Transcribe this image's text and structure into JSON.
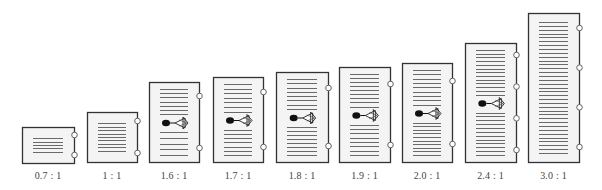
{
  "figure": {
    "page_fill": "#f4f4f4",
    "border_color": "#333333",
    "line_color": "#6a6a6a",
    "hole_color": "#ffffff"
  },
  "pages": [
    {
      "ratio": "0.7 : 1",
      "x": 22,
      "y": 127,
      "w": 52,
      "h": 36,
      "lines": [
        5
      ],
      "holes": 2,
      "figure": false
    },
    {
      "ratio": "1 : 1",
      "x": 87,
      "y": 112,
      "w": 50,
      "h": 50,
      "lines": [
        9
      ],
      "holes": 2,
      "figure": false
    },
    {
      "ratio": "1.6 : 1",
      "x": 149,
      "y": 82,
      "w": 50,
      "h": 80,
      "lines": [
        7,
        5
      ],
      "holes": 2,
      "figure": true
    },
    {
      "ratio": "1.7 : 1",
      "x": 213,
      "y": 77,
      "w": 50,
      "h": 85,
      "lines": [
        7,
        7
      ],
      "holes": 2,
      "figure": true
    },
    {
      "ratio": "1.8 : 1",
      "x": 276,
      "y": 72,
      "w": 52,
      "h": 90,
      "lines": [
        8,
        8
      ],
      "holes": 2,
      "figure": true
    },
    {
      "ratio": "1.9 : 1",
      "x": 339,
      "y": 67,
      "w": 51,
      "h": 95,
      "lines": [
        9,
        8
      ],
      "holes": 2,
      "figure": true
    },
    {
      "ratio": "2.0 : 1",
      "x": 402,
      "y": 63,
      "w": 50,
      "h": 99,
      "lines": [
        9,
        10
      ],
      "holes": 2,
      "figure": true
    },
    {
      "ratio": "2.4 : 1",
      "x": 465,
      "y": 43,
      "w": 51,
      "h": 119,
      "lines": [
        13,
        12
      ],
      "holes": 4,
      "figure": true
    },
    {
      "ratio": "3.0 : 1",
      "x": 528,
      "y": 13,
      "w": 51,
      "h": 149,
      "lines": [
        35
      ],
      "holes": 4,
      "figure": false
    }
  ]
}
